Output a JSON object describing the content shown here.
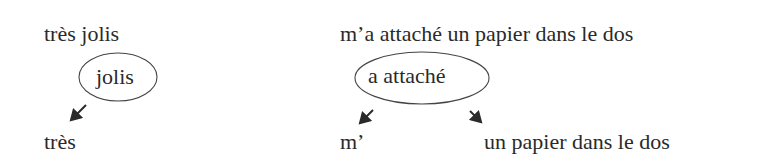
{
  "left": {
    "phrase": "très jolis",
    "head": "jolis",
    "dependents": [
      "très"
    ]
  },
  "right": {
    "phrase": "m’a attaché un papier dans le dos",
    "head": "a attaché",
    "dependents": [
      "m’",
      "un papier dans le dos"
    ]
  },
  "colors": {
    "ink": "#2a2a2a",
    "background": "#ffffff"
  }
}
